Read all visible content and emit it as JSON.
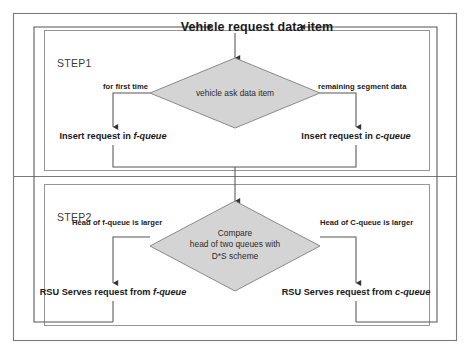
{
  "diagram": {
    "title": "Vehicle request data item",
    "steps": [
      {
        "label": "STEP1"
      },
      {
        "label": "STEP2"
      }
    ],
    "decisions": [
      {
        "name": "vehicle-ask-data-item",
        "text": "vehicle ask data item",
        "lines": [
          "vehicle ask data item"
        ]
      },
      {
        "name": "compare-heads",
        "text": "Compare head of two queues with D*S scheme",
        "lines": [
          "Compare",
          "head of two queues with",
          "D*S scheme"
        ]
      }
    ],
    "branch_labels": {
      "step1_left": "for first time",
      "step1_right": "remaining segment data",
      "step2_left": "Head of f-queue is larger",
      "step2_right": "Head of C-queue is larger"
    },
    "actions": {
      "step1_left_a": "Insert request in ",
      "step1_left_b": "f-queue",
      "step1_right_a": "Insert request in ",
      "step1_right_b": "c-queue",
      "step2_left_a": "RSU Serves request from ",
      "step2_left_b": "f-queue",
      "step2_right_a": "RSU Serves request from ",
      "step2_right_b": "c-queue"
    },
    "colors": {
      "diamond_fill": "#d4d4d4",
      "diamond_stroke": "#8a8a8a",
      "line": "#555555",
      "panel_border": "#8c8c8c",
      "outer_border": "#7a7a7a",
      "text": "#1a1a1a"
    }
  }
}
